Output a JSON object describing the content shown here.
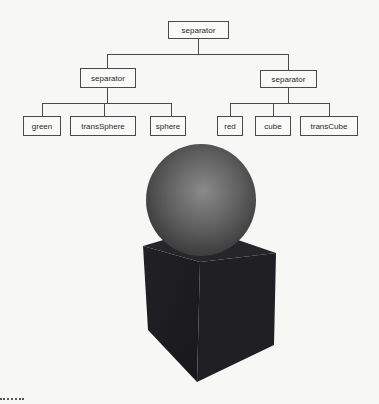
{
  "scene_graph": {
    "root": {
      "label": "separator",
      "children": [
        {
          "label": "separator",
          "children": [
            {
              "label": "green"
            },
            {
              "label": "transSphere"
            },
            {
              "label": "sphere"
            }
          ]
        },
        {
          "label": "separator",
          "children": [
            {
              "label": "red"
            },
            {
              "label": "cube"
            },
            {
              "label": "transCube"
            }
          ]
        }
      ]
    }
  },
  "render": {
    "objects": [
      {
        "type": "sphere",
        "color": "#5a5a5a"
      },
      {
        "type": "cube",
        "color": "#1e1e22"
      }
    ]
  },
  "colors": {
    "background": "#f7f7f5",
    "line": "#4a4a4a",
    "sphere_light": "#8a8a8a",
    "sphere_dark": "#3a3a3a",
    "cube_front": "#1c1c20",
    "cube_side": "#232327",
    "cube_top": "#2a2a2e"
  }
}
